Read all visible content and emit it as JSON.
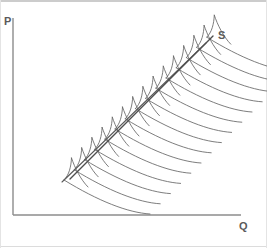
{
  "figure": {
    "kind": "economics-supply-diagram",
    "width": 267,
    "height": 248,
    "background_color": "#ffffff",
    "frame": {
      "top_border_color": "#9a9a9a",
      "bottom_border_color": "#d8d8d8",
      "left_border_color": "#e2e2e2",
      "right_border_color": "#e2e2e2"
    }
  },
  "axes": {
    "line_color": "#8c8c8c",
    "line_width": 1.4,
    "origin": {
      "x": 13,
      "y": 215
    },
    "y_axis": {
      "x": 13,
      "y_top": 18,
      "y_bottom": 215
    },
    "x_axis": {
      "y": 215,
      "x_left": 13,
      "x_right": 241
    },
    "y_label": {
      "text": "P",
      "x": 4,
      "y": 16
    },
    "x_label": {
      "text": "Q",
      "x": 239,
      "y": 221
    }
  },
  "curves": {
    "supply_label": {
      "text": "S",
      "x": 218,
      "y": 30
    },
    "aggregate_supply": {
      "name": "S",
      "description": "aggregate market supply line",
      "color": "#4f4f4f",
      "line_width": 1.3,
      "start": {
        "x": 70,
        "y": 179
      },
      "end": {
        "x": 213,
        "y": 36
      }
    },
    "lower_envelope": {
      "name": "lower envelope",
      "description": "lower boundary line of the shaded band",
      "color": "#5a5a5a",
      "line_width": 1.1,
      "start": {
        "x": 62,
        "y": 182
      },
      "end": {
        "x": 206,
        "y": 43
      }
    },
    "firm_supply_curves": {
      "description": "individual firm supply curves fanning out to the right, each with a steep spike crossing the aggregate line and a long tail sweeping down-right",
      "count": 15,
      "color": "#666666",
      "line_width": 0.85,
      "base_start": {
        "x": 64,
        "y": 180
      },
      "base_step": {
        "dx": 10.2,
        "dy": -10.2
      },
      "spike_rise": 22,
      "tail_length": 86,
      "tail_drop": 34
    }
  },
  "chart_data": {
    "type": "line",
    "title": "",
    "xlabel": "Q",
    "ylabel": "P",
    "legend_position": "inline-right",
    "grid": false,
    "annotations": [
      "P",
      "Q",
      "S"
    ],
    "series": [
      {
        "name": "S",
        "role": "aggregate market supply",
        "x": [
          70,
          93,
          117,
          141,
          165,
          189,
          213
        ],
        "y": [
          179,
          155,
          131,
          108,
          84,
          60,
          36
        ]
      },
      {
        "name": "lower envelope",
        "role": "band lower boundary",
        "x": [
          62,
          86,
          110,
          134,
          158,
          182,
          206
        ],
        "y": [
          182,
          159,
          136,
          113,
          89,
          66,
          43
        ]
      },
      {
        "name": "individual firm supply curves",
        "role": "horizontal summation components",
        "count": 15
      }
    ]
  }
}
